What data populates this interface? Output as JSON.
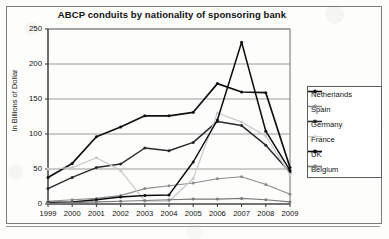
{
  "chart": {
    "title": "ABCP conduits by nationality of sponsoring bank",
    "ylabel": "In Billions of Dollar",
    "legend_title": "Series"
  },
  "axis": {
    "yticks": [
      "250",
      "200",
      "150",
      "100",
      "50",
      "0"
    ],
    "xticks": [
      "1999",
      "2000",
      "2001",
      "2002",
      "2003",
      "2004",
      "2005",
      "2006",
      "2007",
      "2008",
      "2009"
    ]
  },
  "legend": {
    "items": [
      {
        "label": "Netherlands",
        "color": "#111111",
        "marker": "diamond"
      },
      {
        "label": "Spain",
        "color": "#8c8c8c",
        "marker": "square"
      },
      {
        "label": "Germany",
        "color": "#2b2b2b",
        "marker": "triangle"
      },
      {
        "label": "France",
        "color": "#c9c9c9",
        "marker": "cross"
      },
      {
        "label": "UK",
        "color": "#0d0d0d",
        "marker": "star"
      },
      {
        "label": "Belgium",
        "color": "#7a7a7a",
        "marker": "circle"
      }
    ]
  },
  "chart_data": {
    "type": "line",
    "title": "ABCP conduits by nationality of sponsoring bank",
    "xlabel": "",
    "ylabel": "In Billions of Dollar",
    "ylim": [
      0,
      250
    ],
    "ytick_step": 50,
    "grid": true,
    "legend_position": "right",
    "x": [
      "1999",
      "2000",
      "2001",
      "2002",
      "2003",
      "2004",
      "2005",
      "2006",
      "2007",
      "2008",
      "2009"
    ],
    "series": [
      {
        "name": "Netherlands",
        "color": "#111111",
        "values": [
          38,
          58,
          96,
          110,
          126,
          126,
          131,
          172,
          160,
          159,
          52
        ]
      },
      {
        "name": "Spain",
        "color": "#8c8c8c",
        "values": [
          4,
          6,
          8,
          12,
          22,
          26,
          30,
          36,
          39,
          28,
          14
        ]
      },
      {
        "name": "Germany",
        "color": "#2b2b2b",
        "values": [
          22,
          38,
          52,
          57,
          80,
          76,
          88,
          118,
          112,
          84,
          45
        ]
      },
      {
        "name": "France",
        "color": "#c9c9c9",
        "values": [
          50,
          52,
          66,
          48,
          4,
          4,
          36,
          130,
          117,
          97,
          42
        ]
      },
      {
        "name": "UK",
        "color": "#0d0d0d",
        "values": [
          2,
          3,
          6,
          10,
          12,
          13,
          60,
          120,
          231,
          104,
          48
        ]
      },
      {
        "name": "Belgium",
        "color": "#7a7a7a",
        "values": [
          1,
          2,
          3,
          4,
          5,
          6,
          7,
          7,
          8,
          6,
          3
        ]
      }
    ]
  }
}
